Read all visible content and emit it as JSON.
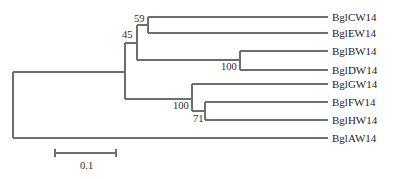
{
  "diagram": {
    "type": "phylogenetic-tree",
    "leaves": [
      {
        "name": "BglCW14",
        "y": 17
      },
      {
        "name": "BglEW14",
        "y": 33
      },
      {
        "name": "BglBW14",
        "y": 51
      },
      {
        "name": "BglDW14",
        "y": 70
      },
      {
        "name": "BglGW14",
        "y": 84
      },
      {
        "name": "BglFW14",
        "y": 102
      },
      {
        "name": "BglHW14",
        "y": 120
      },
      {
        "name": "BglAW14",
        "y": 138
      }
    ],
    "bootstrap": [
      {
        "value": "59",
        "x": 126,
        "y": 21
      },
      {
        "value": "45",
        "x": 114,
        "y": 36
      },
      {
        "value": "100",
        "x": 218,
        "y": 65
      },
      {
        "value": "100",
        "x": 171,
        "y": 98
      },
      {
        "value": "71",
        "x": 193,
        "y": 113
      }
    ],
    "scale_bar": {
      "label": "0.1",
      "x1": 55,
      "x2": 116,
      "y": 153
    },
    "colors": {
      "branch": "#6e6e6e",
      "text": "#1e1e1e"
    }
  }
}
